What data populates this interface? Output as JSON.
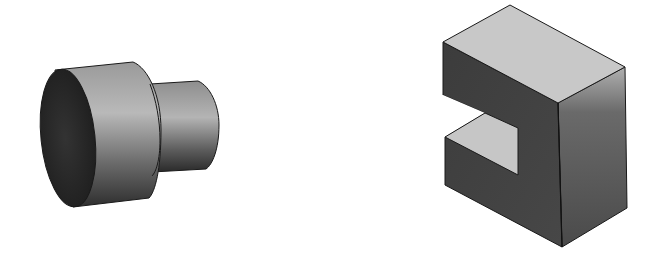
{
  "figure": {
    "title": "Isometric solid models",
    "background": "#ffffff",
    "objects": [
      {
        "id": "stepped-cylinder",
        "label": "Stepped cylinder (two coaxial cylinders)",
        "colors": {
          "end_face": "#2a2a2a",
          "body_light": "#b8b8b8",
          "body_dark": "#3a3a3a",
          "edge": "#1a1a1a"
        }
      },
      {
        "id": "c-block",
        "label": "Rectangular block with slot (C-shaped block)",
        "colors": {
          "top_face": "#c8c8c8",
          "front_face": "#444444",
          "side_face_light": "#a0a0a0",
          "side_face_dark": "#4a4a4a",
          "slot_ledge": "#c8c8c8",
          "edge": "#1a1a1a"
        }
      }
    ]
  }
}
